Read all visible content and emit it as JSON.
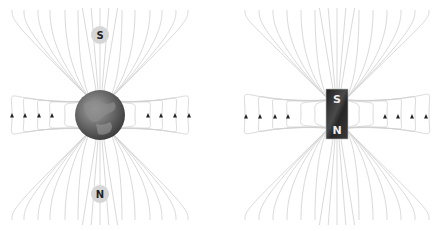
{
  "diagrams": [
    {
      "name": "earth-magnetic-field",
      "center": [
        100,
        115
      ],
      "body": "earth",
      "top_label": "S",
      "bottom_label": "N",
      "arrow_direction": "up"
    },
    {
      "name": "bar-magnet-field",
      "center": [
        337,
        114
      ],
      "body": "bar-magnet",
      "top_label": "S",
      "bottom_label": "N",
      "arrow_direction": "up"
    }
  ],
  "colors": {
    "field_lines": "#cfcfcf",
    "arrows": "#222222",
    "label_disc": "#d6d6d6",
    "magnet": "#2e2e2e",
    "earth": "#6f6f6f"
  }
}
